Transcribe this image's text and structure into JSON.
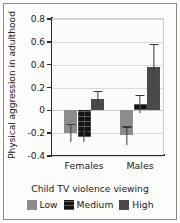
{
  "chart_data": {
    "type": "bar",
    "title": "",
    "xlabel": "Child TV violence viewing",
    "ylabel": "Physical aggression in adulthood",
    "categories": [
      "Females",
      "Males"
    ],
    "ylim": [
      -0.4,
      0.8
    ],
    "yticks": [
      "0.8",
      "0.6",
      "0.4",
      "0.2",
      "0",
      "-0.2",
      "-0.4"
    ],
    "ytick_values": [
      0.8,
      0.6,
      0.4,
      0.2,
      0,
      -0.2,
      -0.4
    ],
    "grid": true,
    "legend_position": "bottom",
    "series": [
      {
        "name": "Low",
        "color": "#8c8c8c",
        "values": [
          -0.2,
          -0.22
        ],
        "errors": [
          0.08,
          0.08
        ]
      },
      {
        "name": "Medium",
        "color": "#141414",
        "values": [
          -0.23,
          0.055
        ],
        "errors": [
          0.05,
          0.08
        ]
      },
      {
        "name": "High",
        "color": "#4a4a4a",
        "values": [
          0.1,
          0.38
        ],
        "errors": [
          0.07,
          0.2
        ]
      }
    ]
  },
  "legend": {
    "items": [
      {
        "label": "Low",
        "style": "low"
      },
      {
        "label": "Medium",
        "style": "medium"
      },
      {
        "label": "High",
        "style": "high"
      }
    ]
  }
}
